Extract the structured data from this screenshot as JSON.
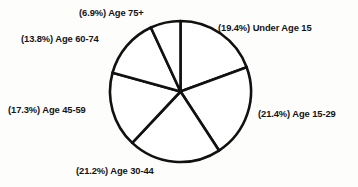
{
  "chart_data": {
    "type": "pie",
    "title": "",
    "xlabel": "",
    "ylabel": "",
    "legend_position": "none",
    "grid": false,
    "start_angle_deg": 90,
    "direction": "clockwise",
    "units": "percent",
    "categories": [
      "Under Age 15",
      "Age 15-29",
      "Age 30-44",
      "Age 45-59",
      "Age 60-74",
      "Age 75+"
    ],
    "values": [
      19.4,
      21.4,
      21.2,
      17.3,
      13.8,
      6.9
    ],
    "slices": [
      {
        "category": "Under Age 15",
        "value": 19.4,
        "label": "(19.4%) Under Age 15",
        "percent_text": "19.4%",
        "start_deg": 0.0,
        "end_deg": 69.84
      },
      {
        "category": "Age 15-29",
        "value": 21.4,
        "label": "(21.4%) Age 15-29",
        "percent_text": "21.4%",
        "start_deg": 69.84,
        "end_deg": 146.88
      },
      {
        "category": "Age 30-44",
        "value": 21.2,
        "label": "(21.2%) Age 30-44",
        "percent_text": "21.2%",
        "start_deg": 146.88,
        "end_deg": 223.2
      },
      {
        "category": "Age 45-59",
        "value": 17.3,
        "label": "(17.3%) Age 45-59",
        "percent_text": "17.3%",
        "start_deg": 223.2,
        "end_deg": 285.48
      },
      {
        "category": "Age 60-74",
        "value": 13.8,
        "label": "(13.8%) Age 60-74",
        "percent_text": "13.8%",
        "start_deg": 285.48,
        "end_deg": 335.16
      },
      {
        "category": "Age 75+",
        "value": 6.9,
        "label": "(6.9%) Age 75+",
        "percent_text": "6.9%",
        "start_deg": 335.16,
        "end_deg": 360.0
      }
    ],
    "colors": {
      "slice_fill": "#ffffff",
      "slice_stroke": "#111111",
      "text": "#141414",
      "background": "#fdfdfc"
    }
  }
}
